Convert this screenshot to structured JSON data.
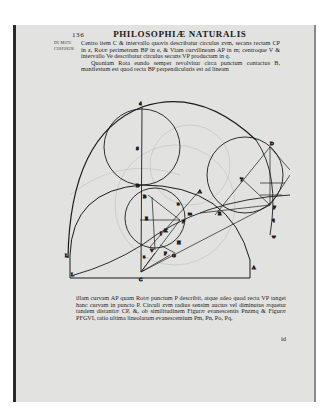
{
  "running_head": {
    "page_number": "136",
    "title": "PHILOSOPHIÆ NATURALIS"
  },
  "marginal_note": [
    "De Motu",
    "Corporum"
  ],
  "top_text": {
    "para1": "Centro item C & intervallo quovis describatur circulus zvm, secans rectam CP in z, Rotæ perimetrum BP in e, & Viam curvilineam AP in m; centroque V & intervallo Ve describatur circulus secans VP productam in q.",
    "para2": "Quoniam Rota eundo semper revolvitur circa punctum contactus B, manifestum est quod recta BP perpendicularis est ad lineam"
  },
  "bottom_text": {
    "para": "illam curvam AP quam Rotæ punctum P describit, atque adeo quod recta VP tanget hanc curvam in puncto P. Circuli zvm radius sensim auctus vel diminutus æquetur tandem distantiæ CP, &, ob similitudinem Figuræ evanescentis Pnzmq & Figuræ PFGVI, ratio ultima lineolarum evanescentium Pm, Pn, Po, Pq,",
    "catchword": "id"
  },
  "diagram": {
    "labels": {
      "top": "d",
      "S_upper": "S",
      "B_upper": "B",
      "B_left": "B",
      "E": "E",
      "A_right": "A",
      "A_bottom": "A",
      "L_left": "L",
      "L_bottom": "L",
      "C": "C",
      "V": "V",
      "P": "P",
      "F": "F",
      "G": "G",
      "H": "H",
      "I": "I",
      "K": "K",
      "R": "R",
      "T": "T",
      "m": "m",
      "n": "n",
      "o": "o",
      "q": "q",
      "z": "z",
      "v": "v",
      "w": "w",
      "D": "D",
      "N": "N"
    }
  }
}
